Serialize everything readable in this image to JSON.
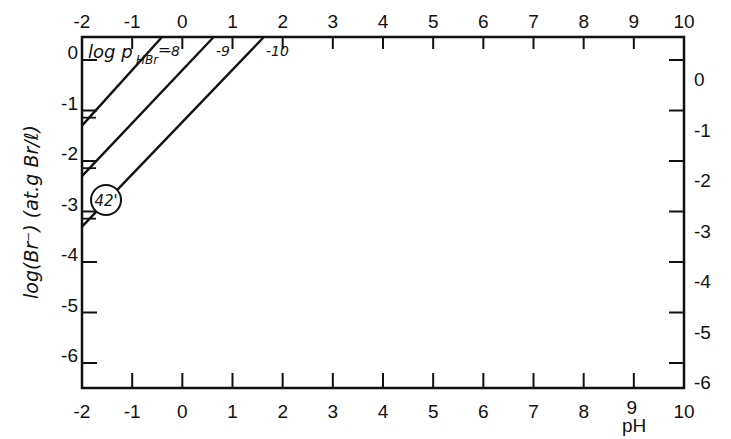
{
  "chart_data": {
    "type": "line",
    "title": "",
    "xlabel": "pH",
    "ylabel": "log(Br⁻) (at.g Br/ℓ)",
    "xlim": [
      -2,
      10
    ],
    "ylim": [
      -6.5,
      0.46
    ],
    "x_ticks": [
      -2,
      -1,
      0,
      1,
      2,
      3,
      4,
      5,
      6,
      7,
      8,
      9,
      10
    ],
    "x_tick_labels": [
      "-2",
      "-1",
      "0",
      "1",
      "2",
      "3",
      "4",
      "5",
      "6",
      "7",
      "8",
      "9",
      "10"
    ],
    "y_ticks": [
      0,
      -1,
      -2,
      -3,
      -4,
      -5,
      -6
    ],
    "y_tick_labels_left": [
      "0",
      "-1",
      "-2",
      "-3",
      "-4",
      "-5",
      "-6"
    ],
    "y_tick_labels_right": [
      "0",
      "-1",
      "-2",
      "-3",
      "-4",
      "-5",
      "-6"
    ],
    "grid": false,
    "legend_title": "log p_HBr =",
    "series": [
      {
        "name": "-8",
        "label": "-8",
        "x": [
          -2,
          -0.4
        ],
        "y": [
          -1.3,
          0.46
        ]
      },
      {
        "name": "-9",
        "label": "-9",
        "x": [
          -2,
          0.63
        ],
        "y": [
          -2.3,
          0.46
        ]
      },
      {
        "name": "-10",
        "label": "-10",
        "x": [
          -2,
          1.63
        ],
        "y": [
          -3.3,
          0.46
        ]
      }
    ],
    "annotations": [
      {
        "text": "42'",
        "x": -1.5,
        "y": -2.8,
        "shape": "circle"
      }
    ]
  },
  "labels": {
    "xlabel": "pH",
    "ylabel": "log(Br⁻) (at.g Br/ℓ)",
    "legend_prefix": "log p",
    "legend_sub": "HBr",
    "legend_eq": "=",
    "line_8": "-8",
    "line_9": "-9",
    "line_10": "-10",
    "circle": "42'"
  }
}
